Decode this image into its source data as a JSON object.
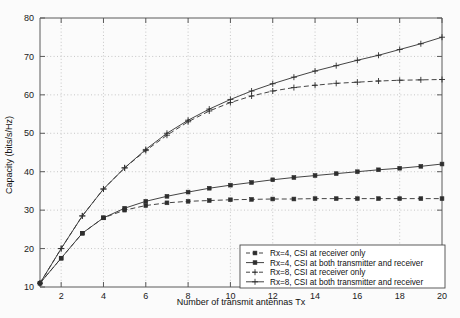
{
  "chart_data": {
    "type": "line",
    "title": "",
    "xlabel": "Number of transmit antennas Tx",
    "ylabel": "Capacity (bits/s/Hz)",
    "xlim": [
      1,
      20
    ],
    "ylim": [
      10,
      80
    ],
    "xticks": [
      2,
      4,
      6,
      8,
      10,
      12,
      14,
      16,
      18,
      20
    ],
    "yticks": [
      10,
      20,
      30,
      40,
      50,
      60,
      70,
      80
    ],
    "grid": true,
    "legend_position": "lower right",
    "x": [
      1,
      2,
      3,
      4,
      5,
      6,
      7,
      8,
      9,
      10,
      11,
      12,
      13,
      14,
      15,
      16,
      17,
      18,
      19,
      20
    ],
    "series": [
      {
        "name": "Rx=4, CSI at receiver only",
        "marker": "square",
        "linestyle": "dashed",
        "values": [
          11.0,
          17.5,
          24.0,
          28.0,
          30.0,
          31.2,
          31.9,
          32.3,
          32.5,
          32.7,
          32.8,
          32.9,
          32.9,
          33.0,
          33.0,
          33.0,
          33.0,
          33.0,
          33.0,
          33.0
        ]
      },
      {
        "name": "Rx=4, CSI at both transmitter and receiver",
        "marker": "square",
        "linestyle": "solid",
        "values": [
          11.0,
          17.5,
          24.0,
          28.0,
          30.5,
          32.3,
          33.6,
          34.7,
          35.7,
          36.5,
          37.2,
          37.9,
          38.5,
          39.0,
          39.5,
          40.0,
          40.5,
          40.9,
          41.4,
          42.0
        ]
      },
      {
        "name": "Rx=8, CSI at receiver only",
        "marker": "plus",
        "linestyle": "dashed",
        "values": [
          11.0,
          20.0,
          28.5,
          35.5,
          41.0,
          45.5,
          49.5,
          53.0,
          55.8,
          58.0,
          59.7,
          61.0,
          61.9,
          62.5,
          63.0,
          63.3,
          63.6,
          63.8,
          63.9,
          64.0
        ]
      },
      {
        "name": "Rx=8, CSI at both transmitter and receiver",
        "marker": "plus",
        "linestyle": "solid",
        "values": [
          11.0,
          20.0,
          28.5,
          35.5,
          41.0,
          45.8,
          50.0,
          53.4,
          56.3,
          58.8,
          61.0,
          62.9,
          64.6,
          66.2,
          67.6,
          69.0,
          70.3,
          71.8,
          73.3,
          75.0
        ]
      }
    ]
  },
  "legend": {
    "items": [
      {
        "label": "Rx=4, CSI at receiver only"
      },
      {
        "label": "Rx=4, CSI at both transmitter and receiver"
      },
      {
        "label": "Rx=8, CSI at receiver only"
      },
      {
        "label": "Rx=8, CSI at both transmitter and receiver"
      }
    ]
  },
  "colors": {
    "axis": "#5a5a5a",
    "grid": "#b9b9b9",
    "series": "#3a3a3a",
    "background": "#fbfbfb"
  }
}
